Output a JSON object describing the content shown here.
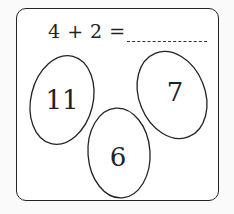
{
  "equation": {
    "text": "4 + 2 =",
    "answer_blank": ""
  },
  "eggs": [
    {
      "label": "11",
      "cx": 62,
      "cy": 100
    },
    {
      "label": "7",
      "cx": 172,
      "cy": 95
    },
    {
      "label": "6",
      "cx": 119,
      "cy": 153
    }
  ],
  "colors": {
    "stroke": "#222222",
    "background": "#ffffff"
  }
}
